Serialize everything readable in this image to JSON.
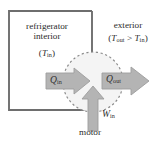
{
  "diagram": {
    "labels": {
      "interior_line1": "refrigerator",
      "interior_line2": "interior",
      "interior_temp_open": "(",
      "interior_temp_symbol": "T",
      "interior_temp_sub": "in",
      "interior_temp_close": ")",
      "exterior": "exterior",
      "exterior_temp_open": "(",
      "exterior_temp_out_symbol": "T",
      "exterior_temp_out_sub": "out",
      "exterior_temp_relation": " > ",
      "exterior_temp_in_symbol": "T",
      "exterior_temp_in_sub": "in",
      "exterior_temp_close": ")",
      "heat_in_symbol": "Q",
      "heat_in_sub": "in",
      "heat_out_symbol": "Q",
      "heat_out_sub": "out",
      "work_in_symbol": "W",
      "work_in_sub": "in",
      "motor": "motor"
    },
    "colors": {
      "background": "#ffffff",
      "box_stroke": "#6e6e6e",
      "circle_fill": "#f4f4f4",
      "circle_dash_stroke": "#8a8a8a",
      "arrow_fill": "#b4b4b4",
      "arrow_stroke": "#9a9a9a",
      "text": "#2b2b2b"
    },
    "geometry": {
      "box": {
        "x": 9,
        "y": 11,
        "width": 83,
        "height": 99
      },
      "circle": {
        "cx": 93,
        "cy": 82,
        "r": 30
      },
      "arrow_q_in": {
        "from_x": 46,
        "to_x": 90,
        "y": 81
      },
      "arrow_q_out": {
        "from_x": 102,
        "to_x": 148,
        "y": 81
      },
      "arrow_w_in": {
        "x": 93,
        "from_y": 130,
        "to_y": 86
      }
    }
  }
}
